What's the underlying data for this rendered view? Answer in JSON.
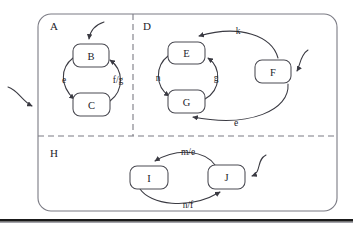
{
  "figure": {
    "kind": "statechart",
    "caption": "",
    "colors": {
      "region_stroke": "#7b7b84",
      "state_stroke": "#4a4a52",
      "edge_stroke": "#3a3a42",
      "text": "#23232a",
      "background": "#ffffff",
      "rule": "#1a1a1a"
    }
  },
  "regions": [
    {
      "id": "A",
      "label": "A",
      "label_x": 50,
      "label_y": 26
    },
    {
      "id": "D",
      "label": "D",
      "label_x": 143,
      "label_y": 26
    },
    {
      "id": "H",
      "label": "H",
      "label_x": 50,
      "label_y": 153
    }
  ],
  "states": [
    {
      "id": "B",
      "label": "B",
      "x": 73,
      "y": 44,
      "w": 36,
      "h": 23,
      "cx": 91,
      "cy": 55.5
    },
    {
      "id": "C",
      "label": "C",
      "x": 73,
      "y": 93,
      "w": 37,
      "h": 23,
      "cx": 91.5,
      "cy": 104.5
    },
    {
      "id": "E",
      "label": "E",
      "x": 168,
      "y": 42,
      "w": 37,
      "h": 22,
      "cx": 186.5,
      "cy": 53
    },
    {
      "id": "G",
      "label": "G",
      "x": 168,
      "y": 90,
      "w": 37,
      "h": 23,
      "cx": 186.5,
      "cy": 101.5
    },
    {
      "id": "F",
      "label": "F",
      "x": 255,
      "y": 60,
      "w": 36,
      "h": 23,
      "cx": 273,
      "cy": 71.5
    },
    {
      "id": "I",
      "label": "I",
      "x": 130,
      "y": 166,
      "w": 38,
      "h": 23,
      "cx": 149,
      "cy": 177.5
    },
    {
      "id": "J",
      "label": "J",
      "x": 208,
      "y": 165,
      "w": 37,
      "h": 24,
      "cx": 226.5,
      "cy": 177
    }
  ],
  "transitions": [
    {
      "id": "t-b-c",
      "from": "B",
      "to": "C",
      "label": "e",
      "label_x": 64,
      "label_y": 80
    },
    {
      "id": "t-c-b",
      "from": "C",
      "to": "B",
      "label": "f/g",
      "label_x": 118,
      "label_y": 80
    },
    {
      "id": "t-e-g",
      "from": "E",
      "to": "G",
      "label": "n",
      "label_x": 158,
      "label_y": 78
    },
    {
      "id": "t-g-e",
      "from": "G",
      "to": "E",
      "label": "g",
      "label_x": 216,
      "label_y": 78
    },
    {
      "id": "t-f-e",
      "from": "F",
      "to": "E",
      "label": "k",
      "label_x": 238,
      "label_y": 31
    },
    {
      "id": "t-f-g",
      "from": "F",
      "to": "G",
      "label": "e",
      "label_x": 236,
      "label_y": 123
    },
    {
      "id": "t-j-i",
      "from": "J",
      "to": "I",
      "label": "m/e",
      "label_x": 188,
      "label_y": 152
    },
    {
      "id": "t-i-j",
      "from": "I",
      "to": "J",
      "label": "n/f",
      "label_x": 188,
      "label_y": 205
    }
  ],
  "entry_arrows": [
    {
      "id": "entry-outer",
      "target": "outer-left-edge"
    },
    {
      "id": "entry-b",
      "target": "B"
    },
    {
      "id": "entry-f",
      "target": "F"
    },
    {
      "id": "entry-j",
      "target": "J"
    }
  ],
  "dividers": [
    {
      "id": "divider-vertical",
      "orientation": "vertical",
      "x": 133,
      "y1": 14,
      "y2": 136
    },
    {
      "id": "divider-horizontal",
      "orientation": "horizontal",
      "y": 136,
      "x1": 38,
      "x2": 337
    }
  ],
  "outer_box": {
    "x": 38,
    "y": 14,
    "w": 299,
    "h": 197,
    "rx": 13
  },
  "footer_rule": {
    "y": 219,
    "x1": 0,
    "x2": 353,
    "thickness": 3
  }
}
